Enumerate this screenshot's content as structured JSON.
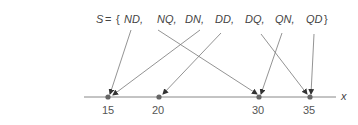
{
  "set": {
    "name": "S",
    "equals": "=",
    "open_brace": "{",
    "close_brace": "}",
    "elements": [
      "ND,",
      "NQ,",
      "DN,",
      "DD,",
      "DQ,",
      "QN,",
      "QD"
    ]
  },
  "axis": {
    "label": "x",
    "ticks": [
      "15",
      "20",
      "30",
      "35"
    ]
  },
  "mapping": [
    {
      "from": "ND",
      "to": "15"
    },
    {
      "from": "NQ",
      "to": "30"
    },
    {
      "from": "DN",
      "to": "15"
    },
    {
      "from": "DD",
      "to": "20"
    },
    {
      "from": "DQ",
      "to": "35"
    },
    {
      "from": "QN",
      "to": "30"
    },
    {
      "from": "QD",
      "to": "35"
    }
  ],
  "colors": {
    "line": "#777777",
    "point": "#666666",
    "text": "#444444"
  }
}
